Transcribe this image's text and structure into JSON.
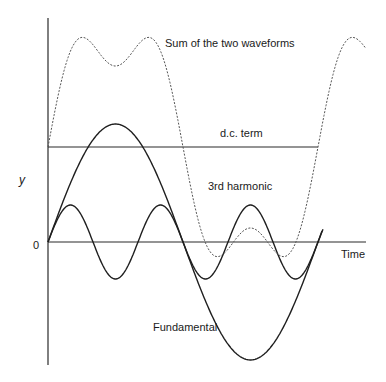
{
  "diagram": {
    "title": "",
    "axes": {
      "y_label": "y",
      "x_label": "Time",
      "origin_label": "0"
    },
    "labels": {
      "sum": "Sum of the two waveforms",
      "dc": "d.c. term",
      "third": "3rd harmonic",
      "fundamental": "Fundamental"
    },
    "colors": {
      "line": "#1f1f1f",
      "axis": "#2a2a2a",
      "sum": "#555555"
    }
  }
}
